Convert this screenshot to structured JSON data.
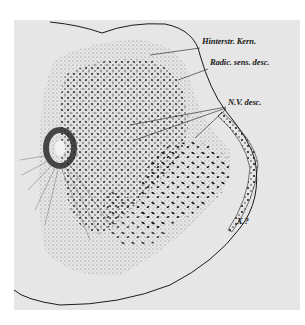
{
  "figure": {
    "type": "histological section drawing",
    "background": "#e6e6e6",
    "ink": "#1a1a1a"
  },
  "labels": [
    {
      "id": "hinterstr-kern",
      "text": "Hinterstr. Kern.",
      "x": 202,
      "y": 42
    },
    {
      "id": "radic-sens-desc",
      "text": "Radic. sens. desc.",
      "x": 210,
      "y": 63
    },
    {
      "id": "n-v-desc",
      "text": "N.V. desc.",
      "x": 228,
      "y": 103
    },
    {
      "id": "x-query",
      "text": "X.?",
      "x": 237,
      "y": 222
    }
  ]
}
